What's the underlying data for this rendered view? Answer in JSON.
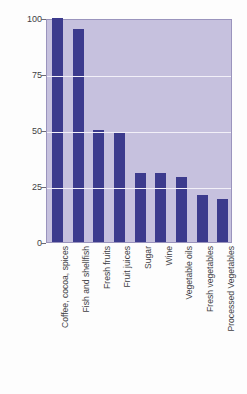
{
  "chart_data": {
    "type": "bar",
    "title": "",
    "xlabel": "",
    "ylabel": "Percent by volume",
    "ylim": [
      0,
      100
    ],
    "yticks": [
      0,
      25,
      50,
      75,
      100
    ],
    "grid": true,
    "legend": false,
    "orientation": "vertical",
    "bar_color": "#3c3b8d",
    "plot_background": "#c6c1de",
    "gridline_color": "#f2f0f8",
    "categories": [
      "Coffee, cocoa, spices",
      "Fish and shellfish",
      "Fresh fruits",
      "Fruit juices",
      "Sugar",
      "Wine",
      "Vegetable oils",
      "Fresh vegetables",
      "Processed Vegetables"
    ],
    "values": [
      100,
      95,
      50,
      49,
      31,
      31,
      29,
      21,
      19
    ]
  }
}
